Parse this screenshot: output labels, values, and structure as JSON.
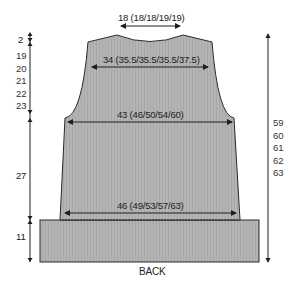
{
  "diagram": {
    "title": "BACK",
    "piece": "back",
    "colors": {
      "fill": "#b4b4b4",
      "outline": "#2a2a2a",
      "arrow": "#1e1e1e",
      "text": "#222222",
      "background": "#ffffff"
    },
    "widths": {
      "neck": "18 (18/18/19/19)",
      "shoulders": "34 (35.5/35.5/35.5/37.5)",
      "chest": "43 (46/50/54/60)",
      "hip": "46 (49/53/57/63)"
    },
    "left_heights": {
      "shoulder_slope": "2",
      "armhole": [
        "19",
        "20",
        "21",
        "22",
        "23"
      ],
      "body": "27",
      "ribbing": "11"
    },
    "right_heights": {
      "total": [
        "59",
        "60",
        "61",
        "62",
        "63"
      ]
    }
  }
}
